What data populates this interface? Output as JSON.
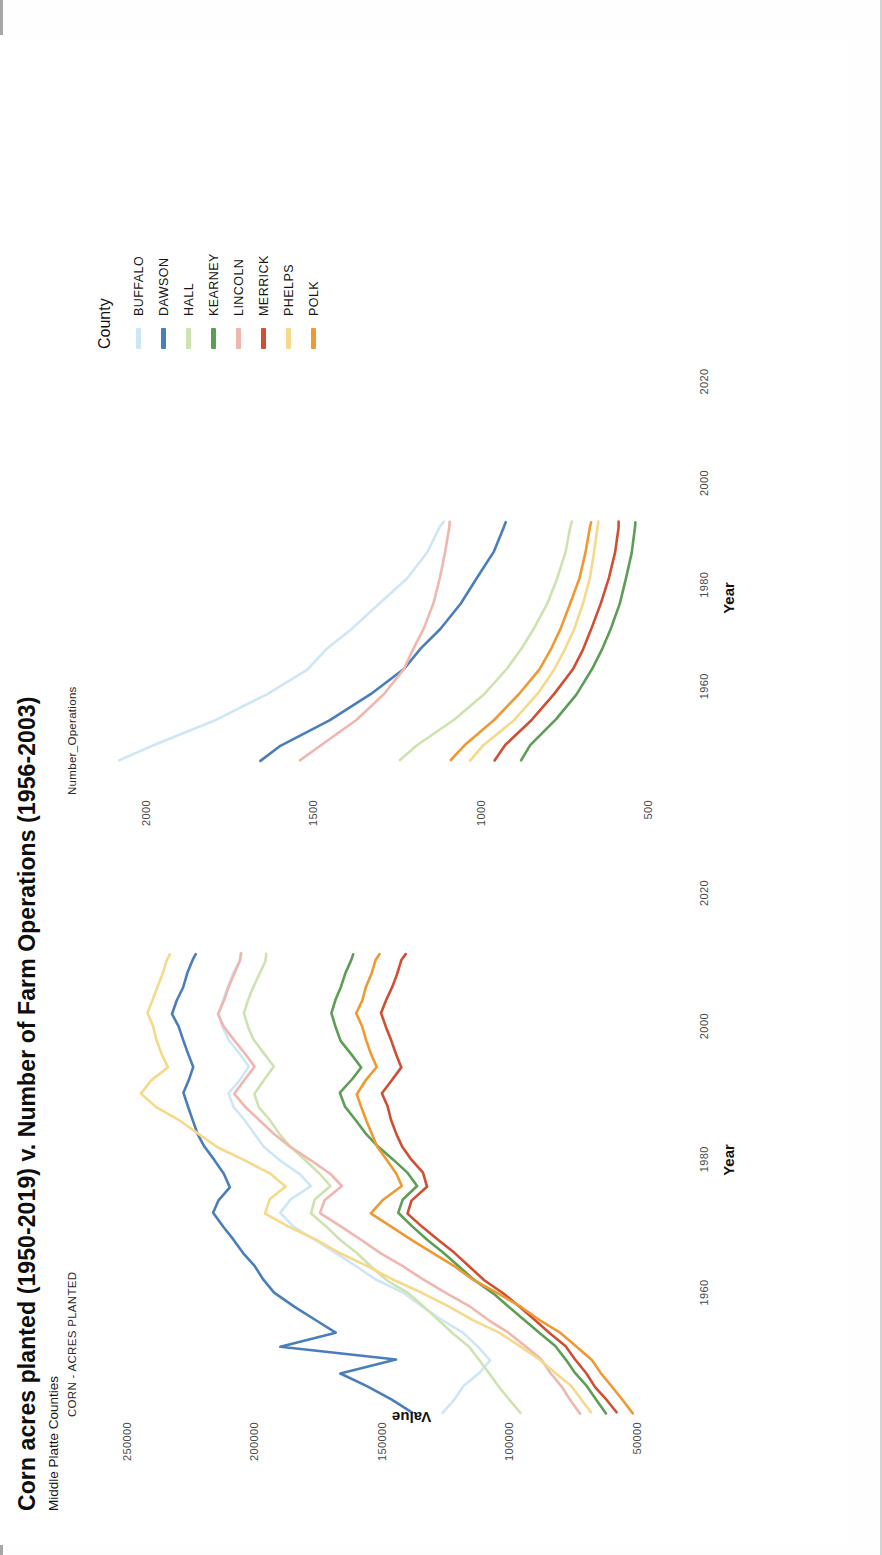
{
  "figure": {
    "title": "Corn acres planted (1950-2019) v. Number of Farm Operations (1956-2003)",
    "subtitle": "Middle Platte Counties"
  },
  "legend": {
    "title": "County",
    "items": [
      {
        "label": "BUFFALO",
        "color": "#cfe7f5"
      },
      {
        "label": "DAWSON",
        "color": "#4a7ebb"
      },
      {
        "label": "HALL",
        "color": "#cfe3b0"
      },
      {
        "label": "KEARNEY",
        "color": "#5d9e55"
      },
      {
        "label": "LINCOLN",
        "color": "#f0b7ae"
      },
      {
        "label": "MERRICK",
        "color": "#cf4f32"
      },
      {
        "label": "PHELPS",
        "color": "#f6d98a"
      },
      {
        "label": "POLK",
        "color": "#ef9933"
      }
    ]
  },
  "axes": {
    "y_title": "Value",
    "x_title": "Year",
    "left_panel_title": "CORN - ACRES PLANTED",
    "right_panel_title": "Number_Operations",
    "left_yticks": [
      "250000",
      "200000",
      "150000",
      "100000",
      "50000"
    ],
    "right_yticks": [
      "2000",
      "1500",
      "1000",
      "500"
    ],
    "xticks": [
      "1960",
      "1980",
      "2000",
      "2020"
    ]
  },
  "chart_data": {
    "type": "line",
    "title": "Corn acres planted (1950-2019) v. Number of Farm Operations (1956-2003)",
    "subtitle": "Middle Platte Counties",
    "xlabel": "Year",
    "ylabel": "Value",
    "legend_title": "County",
    "legend_position": "right",
    "grid": false,
    "panels": [
      {
        "name": "CORN - ACRES PLANTED",
        "xlim": [
          1950,
          2026
        ],
        "ylim": [
          30000,
          262000
        ],
        "xticks": [
          1960,
          1980,
          2000,
          2020
        ],
        "yticks": [
          50000,
          100000,
          150000,
          200000,
          250000
        ],
        "x": [
          1950,
          1952,
          1954,
          1956,
          1958,
          1960,
          1962,
          1964,
          1966,
          1968,
          1970,
          1972,
          1974,
          1976,
          1978,
          1980,
          1982,
          1984,
          1986,
          1988,
          1990,
          1992,
          1994,
          1996,
          1998,
          2000,
          2002,
          2004,
          2006,
          2008,
          2010,
          2012,
          2014,
          2016,
          2018,
          2019
        ],
        "series": [
          {
            "name": "BUFFALO",
            "color": "#cfe7f5",
            "values": [
              126000,
              122000,
              118000,
              112000,
              108000,
              112000,
              118000,
              126000,
              134000,
              142000,
              152000,
              160000,
              168000,
              176000,
              184000,
              190000,
              186000,
              178000,
              182000,
              190000,
              196000,
              200000,
              204000,
              208000,
              210000,
              206000,
              202000,
              206000,
              210000,
              212000,
              214000,
              212000,
              210000,
              208000,
              206000,
              205000
            ]
          },
          {
            "name": "DAWSON",
            "color": "#4a7ebb",
            "values": [
              138000,
              146000,
              156000,
              166000,
              144000,
              190000,
              168000,
              176000,
              184000,
              192000,
              196000,
              200000,
              204000,
              208000,
              212000,
              216000,
              214000,
              210000,
              212000,
              216000,
              220000,
              222000,
              224000,
              226000,
              228000,
              226000,
              224000,
              226000,
              228000,
              230000,
              232000,
              230000,
              228000,
              226000,
              224000,
              223000
            ]
          },
          {
            "name": "HALL",
            "color": "#cfe3b0",
            "values": [
              96000,
              100000,
              104000,
              108000,
              112000,
              116000,
              122000,
              128000,
              134000,
              140000,
              148000,
              154000,
              160000,
              166000,
              172000,
              178000,
              176000,
              170000,
              174000,
              180000,
              186000,
              190000,
              194000,
              198000,
              200000,
              196000,
              192000,
              196000,
              200000,
              202000,
              204000,
              202000,
              200000,
              198000,
              196000,
              195000
            ]
          },
          {
            "name": "KEARNEY",
            "color": "#5d9e55",
            "values": [
              62000,
              66000,
              70000,
              74000,
              78000,
              82000,
              88000,
              94000,
              100000,
              106000,
              114000,
              120000,
              126000,
              132000,
              138000,
              144000,
              142000,
              136000,
              140000,
              146000,
              152000,
              156000,
              160000,
              164000,
              166000,
              162000,
              158000,
              162000,
              166000,
              168000,
              170000,
              168000,
              166000,
              164000,
              162000,
              161000
            ]
          },
          {
            "name": "LINCOLN",
            "color": "#f0b7ae",
            "values": [
              72000,
              76000,
              80000,
              84000,
              88000,
              94000,
              100000,
              108000,
              116000,
              124000,
              134000,
              142000,
              150000,
              158000,
              166000,
              174000,
              172000,
              166000,
              170000,
              178000,
              186000,
              192000,
              198000,
              204000,
              208000,
              204000,
              200000,
              204000,
              208000,
              212000,
              214000,
              212000,
              210000,
              208000,
              206000,
              205000
            ]
          },
          {
            "name": "MERRICK",
            "color": "#cf4f32",
            "values": [
              58000,
              62000,
              66000,
              70000,
              74000,
              78000,
              84000,
              90000,
              96000,
              102000,
              110000,
              116000,
              122000,
              128000,
              134000,
              140000,
              138000,
              132000,
              134000,
              138000,
              142000,
              144000,
              146000,
              148000,
              150000,
              146000,
              142000,
              144000,
              146000,
              148000,
              150000,
              148000,
              146000,
              144000,
              142000,
              141000
            ]
          },
          {
            "name": "PHELPS",
            "color": "#f6d98a",
            "values": [
              68000,
              72000,
              76000,
              82000,
              88000,
              96000,
              104000,
              114000,
              124000,
              134000,
              146000,
              156000,
              166000,
              176000,
              186000,
              196000,
              194000,
              188000,
              194000,
              204000,
              214000,
              222000,
              230000,
              238000,
              244000,
              240000,
              234000,
              236000,
              238000,
              240000,
              242000,
              240000,
              238000,
              236000,
              234000,
              233000
            ]
          },
          {
            "name": "POLK",
            "color": "#ef9933",
            "values": [
              52000,
              56000,
              60000,
              64000,
              68000,
              74000,
              80000,
              88000,
              96000,
              104000,
              114000,
              122000,
              130000,
              138000,
              146000,
              154000,
              150000,
              142000,
              144000,
              148000,
              152000,
              154000,
              156000,
              158000,
              160000,
              156000,
              152000,
              154000,
              156000,
              158000,
              160000,
              158000,
              156000,
              154000,
              152000,
              151000
            ]
          }
        ]
      },
      {
        "name": "Number_Operations",
        "xlim": [
          1950,
          2026
        ],
        "ylim": [
          380,
          2150
        ],
        "xticks": [
          1960,
          1980,
          2000,
          2020
        ],
        "yticks": [
          500,
          1000,
          1500,
          2000
        ],
        "x": [
          1956,
          1959,
          1964,
          1969,
          1974,
          1978,
          1982,
          1987,
          1992,
          1997,
          2002,
          2003
        ],
        "series": [
          {
            "name": "BUFFALO",
            "color": "#cfe7f5",
            "values": [
              2080,
              1980,
              1790,
              1640,
              1520,
              1460,
              1380,
              1300,
              1220,
              1160,
              1120,
              1110
            ]
          },
          {
            "name": "DAWSON",
            "color": "#4a7ebb",
            "values": [
              1660,
              1600,
              1450,
              1330,
              1230,
              1180,
              1120,
              1060,
              1010,
              960,
              930,
              925
            ]
          },
          {
            "name": "LINCOLN",
            "color": "#f0b7ae",
            "values": [
              1540,
              1480,
              1370,
              1290,
              1230,
              1200,
              1170,
              1140,
              1120,
              1105,
              1095,
              1093
            ]
          },
          {
            "name": "HALL",
            "color": "#cfe3b0",
            "values": [
              1240,
              1190,
              1080,
              990,
              920,
              880,
              840,
              800,
              770,
              745,
              730,
              728
            ]
          },
          {
            "name": "PHELPS",
            "color": "#f6d98a",
            "values": [
              1030,
              990,
              900,
              830,
              780,
              750,
              720,
              695,
              675,
              660,
              650,
              648
            ]
          },
          {
            "name": "POLK",
            "color": "#ef9933",
            "values": [
              1090,
              1050,
              960,
              885,
              825,
              790,
              760,
              730,
              705,
              685,
              672,
              670
            ]
          },
          {
            "name": "MERRICK",
            "color": "#cf4f32",
            "values": [
              960,
              925,
              845,
              780,
              725,
              695,
              668,
              640,
              618,
              600,
              588,
              586
            ]
          },
          {
            "name": "KEARNEY",
            "color": "#5d9e55",
            "values": [
              880,
              850,
              775,
              715,
              665,
              635,
              610,
              585,
              565,
              548,
              538,
              536
            ]
          }
        ]
      }
    ]
  }
}
